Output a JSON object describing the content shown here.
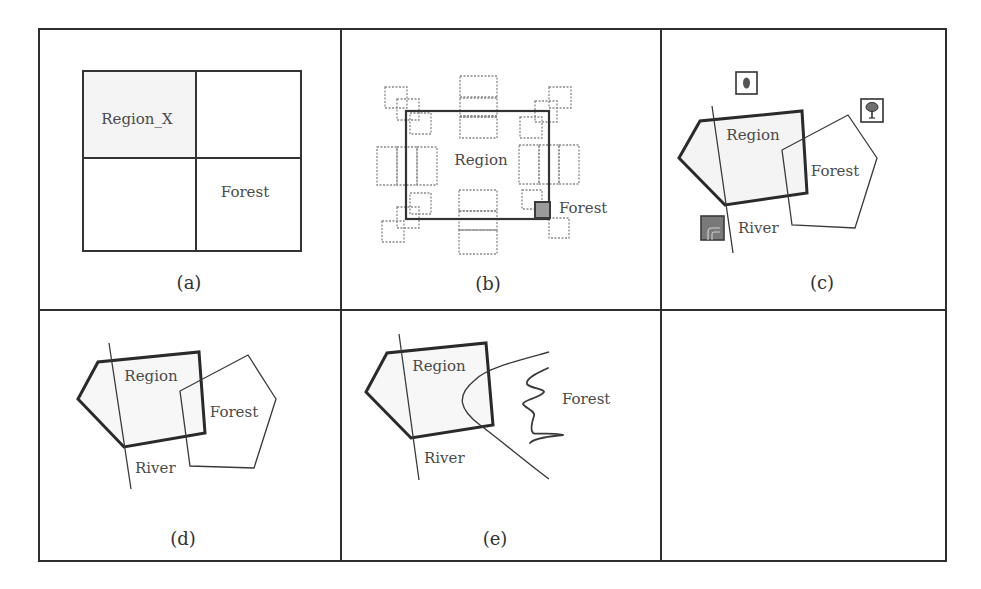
{
  "figure": {
    "layout": "3x2 grid of panels",
    "colors": {
      "frame": "#2e2e2e",
      "stroke": "#333333",
      "text": "#4a4a4a",
      "region_fill": "#f4f4f4",
      "dotted": "#8a8a8a",
      "dark_fill": "#555555",
      "icon_fill": "#6e6e6e"
    },
    "panels": [
      {
        "id": "a",
        "caption": "(a)",
        "description": "raster grid 2x2",
        "labels": {
          "region": "Region_X",
          "forest": "Forest"
        }
      },
      {
        "id": "b",
        "caption": "(b)",
        "description": "rectangle with surrounding dotted bounding boxes",
        "labels": {
          "region": "Region",
          "forest": "Forest"
        }
      },
      {
        "id": "c",
        "caption": "(c)",
        "description": "vector polygons with symbol icons",
        "labels": {
          "region": "Region",
          "forest": "Forest",
          "river": "River"
        },
        "icons": [
          "oval-symbol-icon",
          "tree-icon",
          "river-symbol-icon"
        ]
      },
      {
        "id": "d",
        "caption": "(d)",
        "description": "vector polygons",
        "labels": {
          "region": "Region",
          "forest": "Forest",
          "river": "River"
        }
      },
      {
        "id": "e",
        "caption": "(e)",
        "description": "fuzzy boundary forest",
        "labels": {
          "region": "Region",
          "forest": "Forest",
          "river": "River"
        }
      },
      {
        "id": "f",
        "caption": "",
        "description": "empty panel"
      }
    ]
  }
}
